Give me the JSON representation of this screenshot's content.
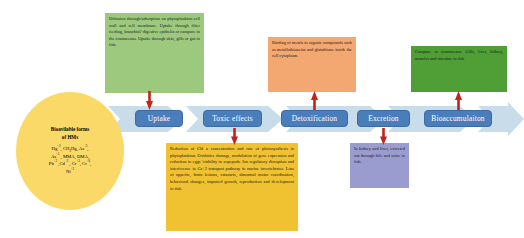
{
  "diagram": {
    "colors": {
      "chevron_band": "#c9dcea",
      "pill": "#4a7ebb",
      "pill_text": "#ffffff",
      "connector_arrow": "#c0241b",
      "ellipse": "#fbd969",
      "box_uptake": "#9dc97f",
      "box_toxic": "#f0c232",
      "box_detox": "#f4a871",
      "box_excretion": "#9a9cd0",
      "box_bioaccumulation": "#4f9e36"
    },
    "source": {
      "title": "Bioavilable forms of HMs",
      "species": "Hg+2, CH3Hg, As+3, As+5 , MMA, DMA, Pb+2 ,Cd+2 , Cr+3, Cr+6, Ni+2"
    },
    "stages": [
      {
        "id": "uptake",
        "label": "Uptake"
      },
      {
        "id": "toxic-effects",
        "label": "Toxic effects"
      },
      {
        "id": "detoxification",
        "label": "Detoxification"
      },
      {
        "id": "excretion",
        "label": "Excretion"
      },
      {
        "id": "bioaccumulation",
        "label": "Bioaccumulaiton"
      }
    ],
    "boxes": {
      "uptake": "Diffusion through/adsorption on phytoplankton cell wall and cell membrane. Uptake through filter feeding, branchial/ digestive epithelia or carapace in the crustaceans. Uptake through skin, gills or gut in fish.",
      "toxic_effects": "Reduction of Chl a concentration and rate of photosynthesis in phytoplankton. Oxidative damage, modulation of  gene expression and reduction in eggs 'viability  in copepods. Ion regulatory disruption and interference in Ca+2 transport pathway in marine invertebrates. Loss of appetite, brain lesions, cataracts, abnormal motor coordination, behavioral changes, impaired growth, reproduction and development in fish.",
      "detoxification": "Binding of metals to organic compounds such as metallothioneins and glutathione inside the cell cytoplasm.",
      "excretion": "In kidney and liver, excreted out through bile and urine in fish.",
      "bioaccumulation": "Carapace in crustaceans. Gills, liver, kidney, muscles and intestine in fish"
    }
  }
}
